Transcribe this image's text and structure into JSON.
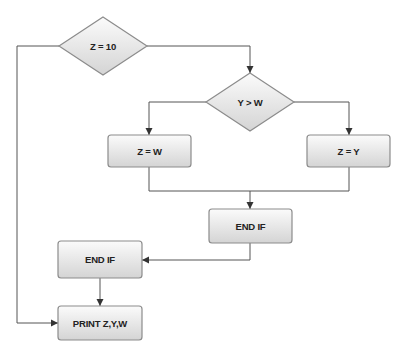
{
  "diagram": {
    "type": "flowchart",
    "colors": {
      "background": "#ffffff",
      "node_fill_top": "#fafafa",
      "node_fill_bottom": "#d6d6d6",
      "node_border": "#8c8c8c",
      "edge": "#555555",
      "text": "#222222"
    },
    "nodes": [
      {
        "id": "d1",
        "shape": "diamond",
        "label": "Z = 10",
        "cx": 103,
        "cy": 46,
        "w": 88,
        "h": 58
      },
      {
        "id": "d2",
        "shape": "diamond",
        "label": "Y > W",
        "cx": 250,
        "cy": 102,
        "w": 88,
        "h": 58
      },
      {
        "id": "b1",
        "shape": "rect",
        "label": "Z = W",
        "x": 108,
        "y": 135,
        "w": 83,
        "h": 32
      },
      {
        "id": "b2",
        "shape": "rect",
        "label": "Z = Y",
        "x": 307,
        "y": 135,
        "w": 83,
        "h": 32
      },
      {
        "id": "b3",
        "shape": "rect",
        "label": "END IF",
        "x": 209,
        "y": 209,
        "w": 83,
        "h": 34
      },
      {
        "id": "b4",
        "shape": "rect",
        "label": "END IF",
        "x": 58,
        "y": 241,
        "w": 84,
        "h": 37
      },
      {
        "id": "b5",
        "shape": "rect",
        "label": "PRINT Z,Y,W",
        "x": 58,
        "y": 306,
        "w": 84,
        "h": 34
      }
    ],
    "edges": [
      {
        "from": "d1",
        "to": "d2",
        "points": [
          [
            147,
            46
          ],
          [
            250,
            46
          ],
          [
            250,
            73
          ]
        ],
        "arrow": true
      },
      {
        "from": "d1",
        "to": "b5",
        "points": [
          [
            59,
            46
          ],
          [
            17,
            46
          ],
          [
            17,
            323
          ],
          [
            58,
            323
          ]
        ],
        "arrow": true
      },
      {
        "from": "d2",
        "to": "b1",
        "points": [
          [
            206,
            102
          ],
          [
            149,
            102
          ],
          [
            149,
            135
          ]
        ],
        "arrow": true
      },
      {
        "from": "d2",
        "to": "b2",
        "points": [
          [
            294,
            102
          ],
          [
            349,
            102
          ],
          [
            349,
            135
          ]
        ],
        "arrow": true
      },
      {
        "from": "b1",
        "to": "b3",
        "points": [
          [
            149,
            167
          ],
          [
            149,
            191
          ],
          [
            250,
            191
          ]
        ],
        "arrow": false
      },
      {
        "from": "b2",
        "to": "b3",
        "points": [
          [
            349,
            167
          ],
          [
            349,
            191
          ],
          [
            250,
            191
          ],
          [
            250,
            209
          ]
        ],
        "arrow": true
      },
      {
        "from": "b3",
        "to": "b4",
        "points": [
          [
            250,
            243
          ],
          [
            250,
            260
          ],
          [
            142,
            260
          ]
        ],
        "arrow": true
      },
      {
        "from": "b4",
        "to": "b5",
        "points": [
          [
            100,
            278
          ],
          [
            100,
            306
          ]
        ],
        "arrow": true
      }
    ]
  }
}
